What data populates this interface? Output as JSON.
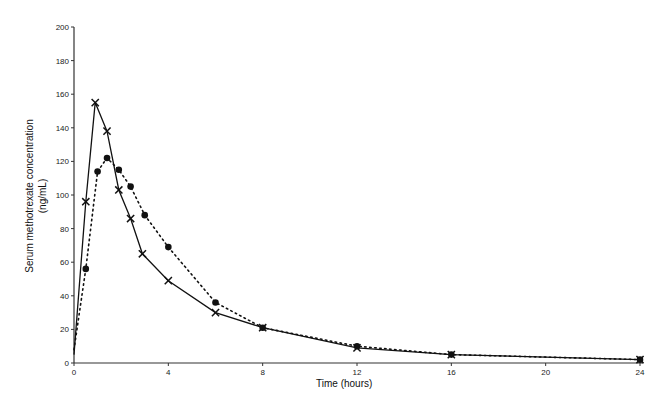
{
  "chart_data": {
    "type": "line",
    "title": "",
    "xlabel": "Time (hours)",
    "ylabel": "Serum methotrexate concentration",
    "ylabel_unit": "(ng/mL)",
    "xlim": [
      0,
      24
    ],
    "ylim": [
      0,
      200
    ],
    "x_ticks": [
      0,
      4,
      8,
      12,
      16,
      20,
      24
    ],
    "y_ticks": [
      0,
      20,
      40,
      60,
      80,
      100,
      120,
      140,
      160,
      180,
      200
    ],
    "grid": false,
    "legend": null,
    "series": [
      {
        "name": "Series A (solid line, cross markers)",
        "line_style": "solid",
        "marker": "cross",
        "x": [
          0,
          0.5,
          0.9,
          1.4,
          1.9,
          2.4,
          2.9,
          4,
          6,
          8,
          12,
          16,
          24
        ],
        "y": [
          5,
          96,
          155,
          138,
          103,
          86,
          65,
          49,
          30,
          21,
          9,
          5,
          2
        ]
      },
      {
        "name": "Series B (dotted line, circle markers)",
        "line_style": "dotted",
        "marker": "circle",
        "x": [
          0,
          0.5,
          1,
          1.4,
          1.9,
          2.4,
          3,
          4,
          6,
          8,
          12,
          16,
          24
        ],
        "y": [
          8,
          56,
          114,
          122,
          115,
          105,
          88,
          69,
          36,
          21,
          10,
          5,
          2
        ]
      }
    ]
  }
}
